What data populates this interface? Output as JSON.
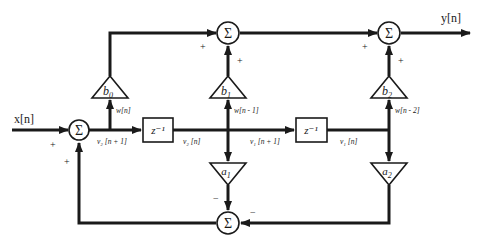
{
  "diagram": {
    "input_label": "x[n]",
    "output_label": "y[n]",
    "sum_symbol": "Σ",
    "delay_label": "z⁻¹",
    "multipliers": {
      "b0": "b0",
      "b1": "b1",
      "b2": "b2",
      "a1": "a1",
      "a2": "a2"
    },
    "signals": {
      "w_n": "w[n]",
      "w_n1": "w[n - 1]",
      "w_n2": "w[n - 2]",
      "v2_np1": "v₂ [n + 1]",
      "v2_n": "v₂ [n]",
      "v1_np1": "v₁ [n + 1]",
      "v1_n": "v₁ [n]"
    },
    "signs": {
      "plus": "+",
      "minus": "−"
    },
    "colors": {
      "line": "#1a1a1a",
      "background": "#ffffff"
    }
  }
}
